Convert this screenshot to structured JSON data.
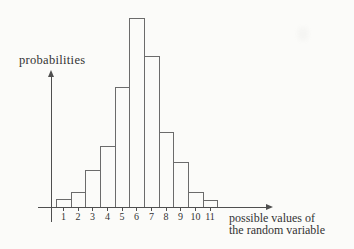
{
  "figure": {
    "y_axis_label": "probabilities",
    "x_axis_caption_line1": "possible values of",
    "x_axis_caption_line2": "the random variable"
  },
  "chart_data": {
    "type": "bar",
    "title": "",
    "ylabel": "probabilities",
    "xlabel": "possible values of the random variable",
    "categories": [
      "1",
      "2",
      "3",
      "4",
      "5",
      "6",
      "7",
      "8",
      "9",
      "10",
      "11"
    ],
    "values": [
      0.011,
      0.02,
      0.051,
      0.083,
      0.164,
      0.258,
      0.206,
      0.102,
      0.061,
      0.02,
      0.01
    ],
    "values_note": "probabilities estimated from relative bar heights; no numeric y-axis scale is shown in the figure",
    "ylim": [
      0,
      0.28
    ],
    "grid": false,
    "legend": false,
    "bar_fill": "none",
    "bar_outline_color": "#6b6b6b"
  },
  "colors": {
    "background": "#fbfbf9",
    "axis_line": "#4f4f4f",
    "text": "#333333"
  }
}
